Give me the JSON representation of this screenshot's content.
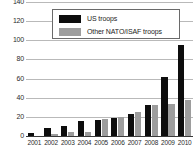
{
  "chart_data": {
    "type": "bar",
    "title": "",
    "subtitle": "",
    "xlabel": "",
    "ylabel": "",
    "categories": [
      "2001",
      "2002",
      "2003",
      "2004",
      "2005",
      "2006",
      "2007",
      "2008",
      "2009",
      "2010"
    ],
    "series": [
      {
        "name": "US troops",
        "color": "#0d0d0d",
        "values": [
          3,
          8,
          10,
          16,
          17,
          19,
          23,
          32,
          62,
          95
        ]
      },
      {
        "name": "Other NATO/ISAF troops",
        "color": "#9d9d9d",
        "values": [
          0,
          2,
          4,
          4,
          18,
          20,
          25,
          32,
          33,
          38
        ]
      }
    ],
    "ylim": [
      0,
      140
    ],
    "yticks": [
      0,
      20,
      40,
      60,
      80,
      100,
      120,
      140
    ],
    "ytick_labels": [
      "0",
      "20",
      "40",
      "60",
      "80",
      "100",
      "120",
      "140"
    ],
    "grid": true,
    "legend_position": "top-center",
    "legend_entries": [
      {
        "label": "US troops",
        "color": "#0d0d0d"
      },
      {
        "label": "Other NATO/ISAF troops",
        "color": "#9d9d9d"
      }
    ]
  }
}
